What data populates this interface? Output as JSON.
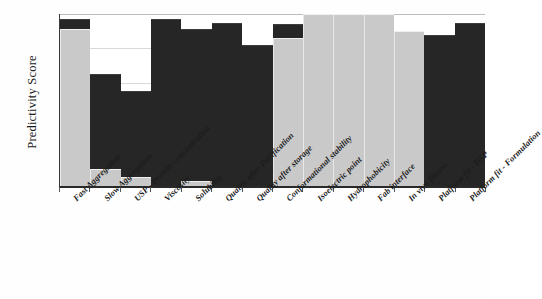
{
  "chart_data": {
    "type": "bar",
    "title": "",
    "subtitle": "",
    "xlabel": "",
    "ylabel": "Predictivity Score",
    "ylim": [
      0,
      100
    ],
    "grid": true,
    "gridlines": [
      20,
      40,
      60,
      80,
      100
    ],
    "legend": "none",
    "stacked": true,
    "categories": [
      "Fast Aggregation",
      "Slow Aggregation",
      "USP - Protein concentration",
      "Viscosity",
      "Solubility",
      "Quality after Purification",
      "Quality after storage",
      "Conformational stability",
      "Isoelectric point",
      "Hydrophobicity",
      "Fab interface",
      "In vivo fitness",
      "Platform fit - DSP",
      "Platform fit - Formulation"
    ],
    "series": [
      {
        "name": "light-segment",
        "color": "#c9c9c9",
        "values": [
          91,
          10,
          5,
          0,
          3,
          0,
          0,
          86,
          100,
          100,
          100,
          90,
          0,
          0
        ]
      },
      {
        "name": "dark-segment",
        "color": "#262626",
        "values": [
          6,
          55,
          50,
          97,
          88,
          95,
          82,
          8,
          0,
          0,
          0,
          0,
          88,
          95
        ]
      }
    ],
    "totals": [
      97,
      65,
      55,
      97,
      91,
      95,
      82,
      94,
      100,
      100,
      100,
      90,
      88,
      95
    ]
  },
  "axis": {
    "y_title": "Predictivity Score"
  }
}
